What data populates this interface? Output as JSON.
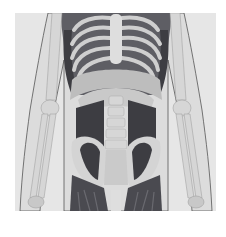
{
  "image": {
    "subject": "anatomical illustration of human torso and pelvis",
    "alt": "Front view anatomical drawing of human torso showing rib cage, diaphragm, lumbar spine, pelvis, psoas and hip muscles, and arm bones",
    "colors": {
      "background": "#ffffff",
      "panel": "#e6e6e6",
      "skin_outline": "#555555",
      "bone": "#cfcfcf",
      "bone_light": "#dedede",
      "muscle_dark": "#3d3d42",
      "muscle_mid": "#6a6a70",
      "diaphragm": "#bdbdbd"
    }
  }
}
